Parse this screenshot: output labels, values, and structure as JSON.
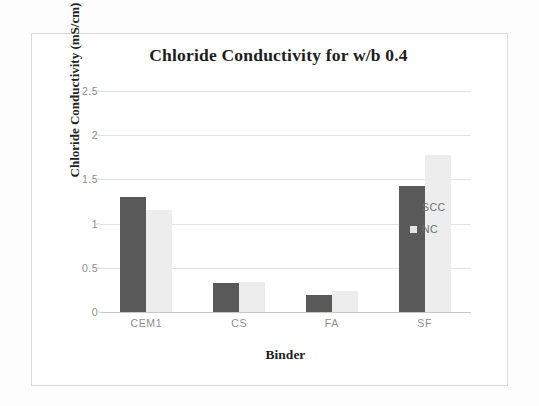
{
  "chart_data": {
    "type": "bar",
    "title": "Chloride Conductivity for w/b 0.4",
    "xlabel": "Binder",
    "ylabel": "Chloride Conductivity (mS/cm)",
    "categories": [
      "CEM1",
      "CS",
      "FA",
      "SF"
    ],
    "series": [
      {
        "name": "SCC",
        "color": "#595959",
        "values": [
          1.3,
          0.33,
          0.19,
          1.43
        ]
      },
      {
        "name": "NC",
        "color": "#ededed",
        "values": [
          1.15,
          0.34,
          0.24,
          1.78
        ]
      }
    ],
    "ylim": [
      0,
      2.5
    ],
    "ytick_labels": [
      "0",
      "0.5",
      "1",
      "1.5",
      "2",
      "2.5"
    ],
    "ytick_values": [
      0,
      0.5,
      1,
      1.5,
      2,
      2.5
    ],
    "grid": true,
    "legend_position": "right"
  }
}
